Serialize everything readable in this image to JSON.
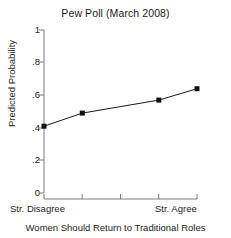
{
  "chart_data": {
    "type": "line",
    "title": "Pew Poll (March 2008)",
    "xlabel": "Women Should Return to Traditional Roles",
    "ylabel": "Predicted Probability",
    "ylim": [
      0,
      1
    ],
    "yticks": [
      "0",
      ".2",
      ".4",
      ".6",
      ".8",
      "1"
    ],
    "ytick_values": [
      0,
      0.2,
      0.4,
      0.6,
      0.8,
      1
    ],
    "xlim": [
      1,
      5
    ],
    "xticks": [
      1,
      2,
      3,
      4,
      5
    ],
    "xtick_labels": [
      "Str. Disagree",
      "",
      "",
      "",
      "Str. Agree"
    ],
    "x_end_left": "Str. Disagree",
    "x_end_right": "Str. Agree",
    "grid": false,
    "legend": "none",
    "marker": "filled-square",
    "line_color": "#1a1a1a",
    "marker_color": "#101010",
    "axis_color": "#7a7a7a",
    "x": [
      1,
      2,
      4,
      5
    ],
    "values": [
      0.41,
      0.49,
      0.57,
      0.64
    ],
    "series": [
      {
        "name": "Predicted Probability",
        "x": [
          1,
          2,
          4,
          5
        ],
        "values": [
          0.41,
          0.49,
          0.57,
          0.64
        ]
      }
    ]
  },
  "figure": {
    "title": "Pew Poll (March 2008)",
    "ylabel": "Predicted Probability",
    "xlabel": "Women Should Return to Traditional Roles",
    "xlab_left": "Str. Disagree",
    "xlab_right": "Str. Agree",
    "ytick_0": "0",
    "ytick_1": ".2",
    "ytick_2": ".4",
    "ytick_3": ".6",
    "ytick_4": ".8",
    "ytick_5": "1"
  }
}
